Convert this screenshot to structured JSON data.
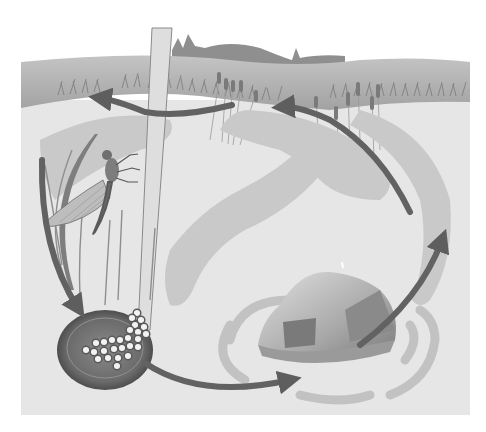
{
  "diagram": {
    "type": "life-cycle",
    "labels_visible": false,
    "stages": [
      {
        "id": "adult",
        "name": "adult mayfly on reed"
      },
      {
        "id": "eggs",
        "name": "eggs in water"
      },
      {
        "id": "nymph",
        "name": "nymph under rock"
      },
      {
        "id": "emergence",
        "name": "emergence near cattails"
      }
    ],
    "arrows": [
      {
        "from": "adult",
        "to": "eggs"
      },
      {
        "from": "eggs",
        "to": "nymph"
      },
      {
        "from": "nymph",
        "to": "emergence"
      },
      {
        "from": "emergence",
        "to": "adult"
      }
    ]
  },
  "colors": {
    "background": "#ffffff",
    "water": "#e4e4e4",
    "bank": "#a9a9a9",
    "bank_far": "#bdbdbd",
    "hills": "#8f8f8f",
    "arrow": "#6a6a6a",
    "crescent": "#c8c8c8",
    "rock_light": "#cfcfcf",
    "rock_dark": "#7a7a7a",
    "egg_dish": "#5c5c5c",
    "egg": "#f2f2f2",
    "reed": "#dedede",
    "insect": "#7d7d7d"
  }
}
